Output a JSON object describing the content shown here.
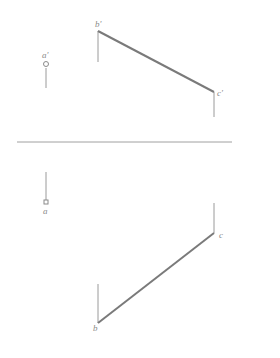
{
  "diagram": {
    "type": "orthographic-projection",
    "axis": {
      "x1": 17,
      "y1": 142,
      "x2": 232,
      "y2": 142,
      "color": "#a0a0a0"
    },
    "front_view": {
      "points": [
        {
          "id": "a'",
          "label": "a'",
          "x": 46,
          "y": 64,
          "marker": "circle",
          "leader": {
            "y1": 68,
            "y2": 88
          },
          "label_pos": {
            "x": 42,
            "y": 58
          }
        },
        {
          "id": "b'",
          "label": "b'",
          "x": 98,
          "y": 31,
          "marker": "none",
          "leader": {
            "y1": 31,
            "y2": 62
          },
          "label_pos": {
            "x": 96,
            "y": 27
          }
        },
        {
          "id": "c'",
          "label": "c'",
          "x": 214,
          "y": 92,
          "marker": "none",
          "leader": {
            "y1": 92,
            "y2": 117
          },
          "label_pos": {
            "x": 217,
            "y": 96
          }
        }
      ],
      "segments": [
        {
          "from": "b'",
          "to": "c'",
          "weight": "thick"
        }
      ]
    },
    "top_view": {
      "points": [
        {
          "id": "a",
          "label": "a",
          "x": 46,
          "y": 203,
          "marker": "square",
          "leader": {
            "y1": 172,
            "y2": 200
          },
          "label_pos": {
            "x": 43,
            "y": 213
          }
        },
        {
          "id": "c",
          "label": "c",
          "x": 214,
          "y": 233,
          "marker": "none",
          "leader": {
            "y1": 203,
            "y2": 233
          },
          "label_pos": {
            "x": 219,
            "y": 237
          }
        },
        {
          "id": "b",
          "label": "b",
          "x": 98,
          "y": 323,
          "marker": "none",
          "leader": {
            "y1": 284,
            "y2": 323
          },
          "label_pos": {
            "x": 93,
            "y": 330
          }
        }
      ],
      "segments": [
        {
          "from": "b",
          "to": "c",
          "weight": "thick"
        }
      ]
    },
    "colors": {
      "line": "#7a7a7a",
      "thin": "#9a9a9a",
      "label": "#8a8a8a",
      "background": "#ffffff"
    }
  }
}
